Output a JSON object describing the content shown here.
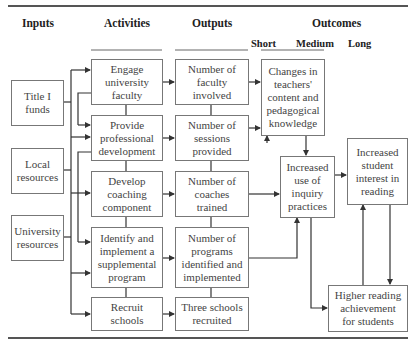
{
  "headers": {
    "inputs": "Inputs",
    "activities": "Activities",
    "outputs": "Outputs",
    "outcomes": "Outcomes",
    "short": "Short",
    "medium": "Medium",
    "long": "Long"
  },
  "inputs": [
    {
      "label": "Title I\nfunds"
    },
    {
      "label": "Local\nresources"
    },
    {
      "label": "University\nresources"
    }
  ],
  "activities": [
    {
      "label": "Engage\nuniversity\nfaculty"
    },
    {
      "label": "Provide\nprofessional\ndevelopment"
    },
    {
      "label": "Develop\ncoaching\ncomponent"
    },
    {
      "label": "Identify and\nimplement a\nsupplemental\nprogram"
    },
    {
      "label": "Recruit\nschools"
    }
  ],
  "outputs": [
    {
      "label": "Number of\nfaculty\ninvolved"
    },
    {
      "label": "Number of\nsessions\nprovided"
    },
    {
      "label": "Number of\ncoaches\ntrained"
    },
    {
      "label": "Number of\nprograms\nidentified and\nimplemented"
    },
    {
      "label": "Three schools\nrecruited"
    }
  ],
  "outcomes": {
    "short": {
      "label": "Changes in\nteachers'\ncontent and\npedagogical\nknowledge"
    },
    "medium_practice": {
      "label": "Increased\nuse of\ninquiry\npractices"
    },
    "long_interest": {
      "label": "Increased\nstudent\ninterest in\nreading"
    },
    "long_achievement": {
      "label": "Higher reading\nachievement\nfor students"
    }
  },
  "colors": {
    "line": "#333333",
    "box_border": "#777777",
    "text": "#444444"
  }
}
